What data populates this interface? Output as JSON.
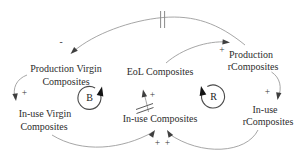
{
  "diagram": {
    "type": "causal-loop-diagram",
    "nodes": {
      "production_virgin": {
        "line1": "Production Virgin",
        "line2": "Composites"
      },
      "inuse_virgin": {
        "line1": "In-use Virgin",
        "line2": "Composites"
      },
      "eol": {
        "label": "EoL Composites"
      },
      "inuse": {
        "label": "In-use Composites"
      },
      "production_r": {
        "line1": "Production",
        "line2": "rComposites"
      },
      "inuse_r": {
        "line1": "In-use",
        "line2": "rComposites"
      }
    },
    "loops": [
      {
        "label": "B",
        "kind": "balancing",
        "direction": "counterclockwise"
      },
      {
        "label": "R",
        "kind": "reinforcing",
        "direction": "clockwise"
      }
    ],
    "edges": [
      {
        "from": "Production rComposites",
        "to": "Production Virgin Composites",
        "sign": "-",
        "delay": true
      },
      {
        "from": "EoL Composites",
        "to": "Production rComposites",
        "sign": "+",
        "delay": false
      },
      {
        "from": "Production Virgin Composites",
        "to": "In-use Virgin Composites",
        "sign": "+",
        "delay": false
      },
      {
        "from": "Production rComposites",
        "to": "In-use rComposites",
        "sign": "+",
        "delay": false
      },
      {
        "from": "In-use Composites",
        "to": "EoL Composites",
        "sign": "+",
        "delay": true
      },
      {
        "from": "In-use Virgin Composites",
        "to": "In-use Composites",
        "sign": "+",
        "delay": false
      },
      {
        "from": "In-use rComposites",
        "to": "In-use Composites",
        "sign": "+",
        "delay": false
      }
    ],
    "colors": {
      "background": "#ffffff",
      "arc": "#9c9c9c",
      "arrowhead": "#3f3f3f",
      "loop_stroke": "#4a4a4a",
      "loop_arrowhead": "#141414",
      "text": "#2d2d2d"
    }
  }
}
